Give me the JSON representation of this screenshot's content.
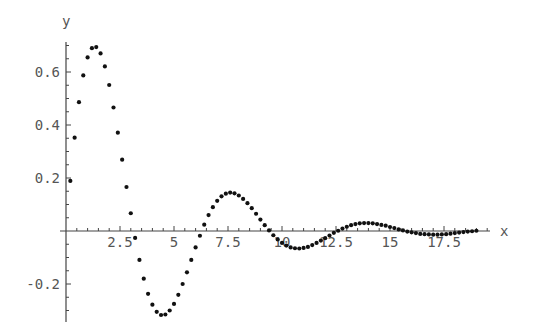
{
  "chart_data": {
    "type": "scatter",
    "title": "",
    "xlabel": "x",
    "ylabel": "y",
    "xlim": [
      0,
      19.5
    ],
    "ylim": [
      -0.34,
      0.72
    ],
    "grid": false,
    "legend": null,
    "x_ticks": [
      2.5,
      5,
      7.5,
      10,
      12.5,
      15,
      17.5
    ],
    "x_tick_labels": [
      "2.5",
      "5",
      "7.5",
      "10",
      "12.5",
      "15",
      "17.5"
    ],
    "y_ticks": [
      -0.2,
      0.2,
      0.4,
      0.6
    ],
    "y_tick_labels": [
      "-0.2",
      "0.2",
      "0.4",
      "0.6"
    ],
    "series": [
      {
        "name": "points",
        "x": [
          0.2,
          0.4,
          0.6,
          0.8,
          1.0,
          1.2,
          1.4,
          1.6,
          1.8,
          2.0,
          2.2,
          2.4,
          2.6,
          2.8,
          3.0,
          3.2,
          3.4,
          3.6,
          3.8,
          4.0,
          4.2,
          4.4,
          4.6,
          4.8,
          5.0,
          5.2,
          5.4,
          5.6,
          5.8,
          6.0,
          6.2,
          6.4,
          6.6,
          6.8,
          7.0,
          7.2,
          7.4,
          7.6,
          7.8,
          8.0,
          8.2,
          8.4,
          8.6,
          8.8,
          9.0,
          9.2,
          9.4,
          9.6,
          9.8,
          10.0,
          10.2,
          10.4,
          10.6,
          10.8,
          11.0,
          11.2,
          11.4,
          11.6,
          11.8,
          12.0,
          12.2,
          12.4,
          12.6,
          12.8,
          13.0,
          13.2,
          13.4,
          13.6,
          13.8,
          14.0,
          14.2,
          14.4,
          14.6,
          14.8,
          15.0,
          15.2,
          15.4,
          15.6,
          15.8,
          16.0,
          16.2,
          16.4,
          16.6,
          16.8,
          17.0,
          17.2,
          17.4,
          17.6,
          17.8,
          18.0,
          18.2,
          18.4,
          18.6,
          18.8,
          19.0
        ],
        "y": [
          0.189,
          0.352,
          0.486,
          0.587,
          0.655,
          0.69,
          0.694,
          0.67,
          0.621,
          0.551,
          0.466,
          0.371,
          0.269,
          0.166,
          0.067,
          -0.026,
          -0.109,
          -0.18,
          -0.237,
          -0.278,
          -0.305,
          -0.317,
          -0.315,
          -0.3,
          -0.275,
          -0.241,
          -0.2,
          -0.156,
          -0.109,
          -0.062,
          -0.018,
          0.024,
          0.06,
          0.09,
          0.114,
          0.131,
          0.141,
          0.145,
          0.142,
          0.134,
          0.121,
          0.105,
          0.086,
          0.065,
          0.043,
          0.022,
          0.002,
          -0.016,
          -0.032,
          -0.045,
          -0.055,
          -0.062,
          -0.065,
          -0.066,
          -0.064,
          -0.06,
          -0.053,
          -0.045,
          -0.036,
          -0.027,
          -0.017,
          -0.007,
          0.001,
          0.009,
          0.016,
          0.022,
          0.026,
          0.029,
          0.03,
          0.03,
          0.029,
          0.026,
          0.023,
          0.02,
          0.015,
          0.011,
          0.006,
          0.002,
          -0.002,
          -0.005,
          -0.008,
          -0.011,
          -0.012,
          -0.013,
          -0.014,
          -0.014,
          -0.013,
          -0.012,
          -0.01,
          -0.008,
          -0.006,
          -0.004,
          -0.002,
          -0.001,
          0.001
        ]
      }
    ]
  },
  "axis_labels": {
    "x": "x",
    "y": "y"
  }
}
